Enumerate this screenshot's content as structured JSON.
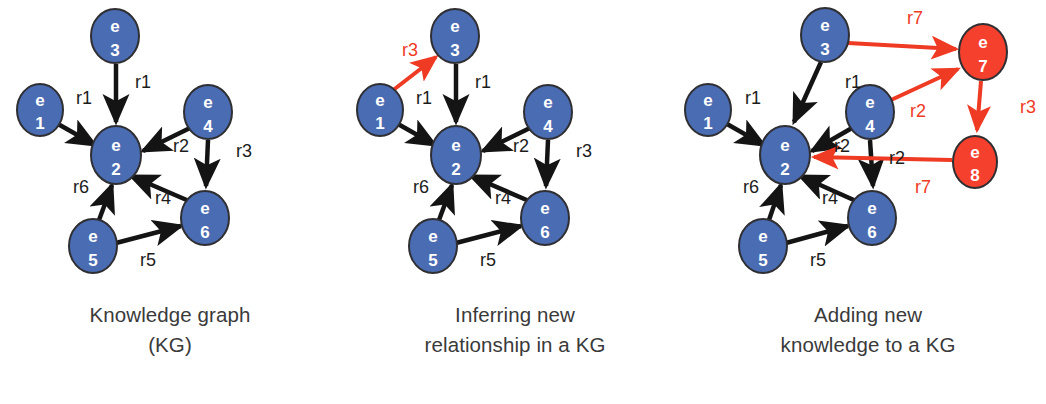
{
  "figure": {
    "colors": {
      "node_blue": "#4a6cb3",
      "node_blue_stroke": "#2f2f33",
      "node_red": "#f4402c",
      "node_red_stroke": "#2f2f33",
      "edge_black": "#141414",
      "edge_red": "#ef3b24",
      "label_black": "#1c1c1c",
      "label_red": "#ef3b24",
      "caption": "#3a3a3a",
      "background": "#ffffff"
    },
    "panels": [
      {
        "id": "knowledge-graph",
        "caption_lines": [
          "Knowledge graph",
          "(KG)"
        ],
        "nodes": [
          {
            "id": "e1",
            "letter": "e",
            "number": "1",
            "cx": 40,
            "cy": 110,
            "rx": 23,
            "ry": 26,
            "color": "blue"
          },
          {
            "id": "e2",
            "letter": "e",
            "number": "2",
            "cx": 116,
            "cy": 155,
            "rx": 25,
            "ry": 29,
            "color": "blue"
          },
          {
            "id": "e3",
            "letter": "e",
            "number": "3",
            "cx": 115,
            "cy": 36,
            "rx": 24,
            "ry": 27,
            "color": "blue"
          },
          {
            "id": "e4",
            "letter": "e",
            "number": "4",
            "cx": 208,
            "cy": 112,
            "rx": 24,
            "ry": 27,
            "color": "blue"
          },
          {
            "id": "e5",
            "letter": "e",
            "number": "5",
            "cx": 93,
            "cy": 246,
            "rx": 24,
            "ry": 27,
            "color": "blue"
          },
          {
            "id": "e6",
            "letter": "e",
            "number": "6",
            "cx": 205,
            "cy": 218,
            "rx": 24,
            "ry": 27,
            "color": "blue"
          }
        ],
        "edges": [
          {
            "id": "e1-e2",
            "from": "e1",
            "to": "e2",
            "label": "r1",
            "lx": 84,
            "ly": 104,
            "color": "black"
          },
          {
            "id": "e3-e2",
            "from": "e3",
            "to": "e2",
            "label": "r1",
            "lx": 143,
            "ly": 88,
            "color": "black"
          },
          {
            "id": "e4-e2",
            "from": "e4",
            "to": "e2",
            "label": "r2",
            "lx": 181,
            "ly": 152,
            "color": "black"
          },
          {
            "id": "e4-e6",
            "from": "e4",
            "to": "e6",
            "label": "r3",
            "lx": 244,
            "ly": 157,
            "color": "black"
          },
          {
            "id": "e6-e2",
            "from": "e6",
            "to": "e2",
            "label": "r4",
            "lx": 163,
            "ly": 204,
            "color": "black"
          },
          {
            "id": "e5-e6",
            "from": "e5",
            "to": "e6",
            "label": "r5",
            "lx": 148,
            "ly": 266,
            "color": "black"
          },
          {
            "id": "e5-e2",
            "from": "e5",
            "to": "e2",
            "label": "r6",
            "lx": 81,
            "ly": 193,
            "color": "black"
          }
        ]
      },
      {
        "id": "inferring-new-relationship",
        "caption_lines": [
          "Inferring new",
          "relationship in a KG"
        ],
        "nodes": [
          {
            "id": "e1",
            "letter": "e",
            "number": "1",
            "cx": 40,
            "cy": 110,
            "rx": 23,
            "ry": 26,
            "color": "blue"
          },
          {
            "id": "e2",
            "letter": "e",
            "number": "2",
            "cx": 116,
            "cy": 155,
            "rx": 25,
            "ry": 29,
            "color": "blue"
          },
          {
            "id": "e3",
            "letter": "e",
            "number": "3",
            "cx": 115,
            "cy": 36,
            "rx": 24,
            "ry": 27,
            "color": "blue"
          },
          {
            "id": "e4",
            "letter": "e",
            "number": "4",
            "cx": 208,
            "cy": 112,
            "rx": 24,
            "ry": 27,
            "color": "blue"
          },
          {
            "id": "e5",
            "letter": "e",
            "number": "5",
            "cx": 93,
            "cy": 246,
            "rx": 24,
            "ry": 27,
            "color": "blue"
          },
          {
            "id": "e6",
            "letter": "e",
            "number": "6",
            "cx": 205,
            "cy": 218,
            "rx": 24,
            "ry": 27,
            "color": "blue"
          }
        ],
        "edges": [
          {
            "id": "e1-e2",
            "from": "e1",
            "to": "e2",
            "label": "r1",
            "lx": 84,
            "ly": 104,
            "color": "black"
          },
          {
            "id": "e3-e2",
            "from": "e3",
            "to": "e2",
            "label": "r1",
            "lx": 143,
            "ly": 88,
            "color": "black"
          },
          {
            "id": "e4-e2",
            "from": "e4",
            "to": "e2",
            "label": "r2",
            "lx": 181,
            "ly": 152,
            "color": "black"
          },
          {
            "id": "e4-e6",
            "from": "e4",
            "to": "e6",
            "label": "r3",
            "lx": 244,
            "ly": 157,
            "color": "black"
          },
          {
            "id": "e6-e2",
            "from": "e6",
            "to": "e2",
            "label": "r4",
            "lx": 163,
            "ly": 204,
            "color": "black"
          },
          {
            "id": "e5-e6",
            "from": "e5",
            "to": "e6",
            "label": "r5",
            "lx": 148,
            "ly": 266,
            "color": "black"
          },
          {
            "id": "e5-e2",
            "from": "e5",
            "to": "e2",
            "label": "r6",
            "lx": 81,
            "ly": 193,
            "color": "black"
          },
          {
            "id": "e1-e3-inferred",
            "from": "e1",
            "to": "e3",
            "label": "r3",
            "lx": 70,
            "ly": 56,
            "color": "red"
          }
        ]
      },
      {
        "id": "adding-new-knowledge",
        "caption_lines": [
          "Adding new",
          "knowledge to a KG"
        ],
        "nodes": [
          {
            "id": "e1",
            "letter": "e",
            "number": "1",
            "cx": 18,
            "cy": 110,
            "rx": 23,
            "ry": 26,
            "color": "blue"
          },
          {
            "id": "e2",
            "letter": "e",
            "number": "2",
            "cx": 95,
            "cy": 155,
            "rx": 25,
            "ry": 29,
            "color": "blue"
          },
          {
            "id": "e3",
            "letter": "e",
            "number": "3",
            "cx": 135,
            "cy": 35,
            "rx": 24,
            "ry": 27,
            "color": "blue"
          },
          {
            "id": "e4",
            "letter": "e",
            "number": "4",
            "cx": 180,
            "cy": 112,
            "rx": 24,
            "ry": 27,
            "color": "blue"
          },
          {
            "id": "e5",
            "letter": "e",
            "number": "5",
            "cx": 73,
            "cy": 246,
            "rx": 24,
            "ry": 27,
            "color": "blue"
          },
          {
            "id": "e6",
            "letter": "e",
            "number": "6",
            "cx": 182,
            "cy": 218,
            "rx": 24,
            "ry": 27,
            "color": "blue"
          },
          {
            "id": "e7",
            "letter": "e",
            "number": "7",
            "cx": 293,
            "cy": 52,
            "rx": 24,
            "ry": 28,
            "color": "red"
          },
          {
            "id": "e8",
            "letter": "e",
            "number": "8",
            "cx": 285,
            "cy": 162,
            "rx": 22,
            "ry": 26,
            "color": "red"
          }
        ],
        "edges": [
          {
            "id": "e1-e2",
            "from": "e1",
            "to": "e2",
            "label": "r1",
            "lx": 63,
            "ly": 104,
            "color": "black"
          },
          {
            "id": "e3-e2",
            "from": "e3",
            "to": "e2",
            "label": "r1",
            "lx": 163,
            "ly": 88,
            "color": "black"
          },
          {
            "id": "e4-e2",
            "from": "e4",
            "to": "e2",
            "label": "r2",
            "lx": 152,
            "ly": 152,
            "color": "black"
          },
          {
            "id": "e4-e6",
            "from": "e4",
            "to": "e6",
            "label": "r2",
            "lx": 207,
            "ly": 164,
            "color": "black"
          },
          {
            "id": "e6-e2",
            "from": "e6",
            "to": "e2",
            "label": "r4",
            "lx": 140,
            "ly": 204,
            "color": "black"
          },
          {
            "id": "e5-e6",
            "from": "e5",
            "to": "e6",
            "label": "r5",
            "lx": 128,
            "ly": 266,
            "color": "black"
          },
          {
            "id": "e5-e2",
            "from": "e5",
            "to": "e2",
            "label": "r6",
            "lx": 61,
            "ly": 193,
            "color": "black"
          },
          {
            "id": "e3-e7-new",
            "from": "e3",
            "to": "e7",
            "label": "r7",
            "lx": 225,
            "ly": 24,
            "color": "red"
          },
          {
            "id": "e4-e7-new",
            "from": "e4",
            "to": "e7",
            "label": "r2",
            "lx": 228,
            "ly": 117,
            "color": "red"
          },
          {
            "id": "e7-e8-new",
            "from": "e7",
            "to": "e8",
            "label": "r3",
            "lx": 338,
            "ly": 113,
            "color": "red"
          },
          {
            "id": "e8-e2-new",
            "from": "e8",
            "to": "e2",
            "label": "r7",
            "lx": 233,
            "ly": 193,
            "color": "red"
          }
        ]
      }
    ]
  }
}
